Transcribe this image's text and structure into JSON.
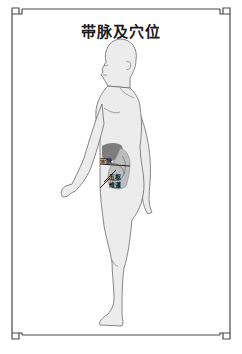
{
  "title": "带脉及穴位",
  "points": [
    {
      "name": "带脉",
      "x": 101,
      "y": 159
    },
    {
      "name": "五枢",
      "x": 108,
      "y": 176
    },
    {
      "name": "维道",
      "x": 108,
      "y": 183
    }
  ],
  "colors": {
    "border": "#4a4a4a",
    "body_fill": "#ececec",
    "body_outline": "#6a6a6a",
    "organ_dark": "#7d7d7d",
    "organ_light": "#bdbdbd"
  }
}
